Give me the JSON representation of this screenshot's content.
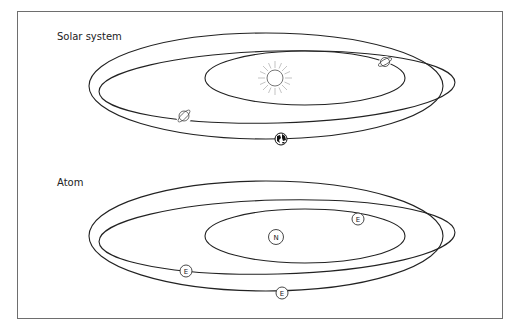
{
  "diagrams": [
    {
      "title": "Solar system",
      "center_icon": "sun-icon",
      "bodies": [
        "planet-ringed-icon",
        "planet-ringed-icon",
        "earth-icon"
      ]
    },
    {
      "title": "Atom",
      "nucleus_label": "N",
      "electron_label": "E"
    }
  ]
}
